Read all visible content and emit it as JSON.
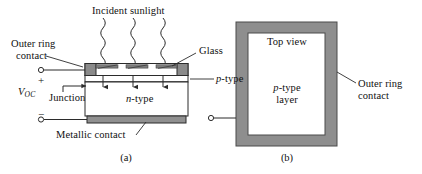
{
  "figure": {
    "colors": {
      "ink": "#101010",
      "line": "#2b2b2b",
      "glass_fill": "#ffffff",
      "contact_gray": "#8a8a8a",
      "metal_gray": "#909090",
      "ring_gray": "#8e8e8e",
      "p_layer_fill": "#ffffff",
      "background": "#ffffff"
    }
  },
  "panel_a": {
    "caption": "(a)",
    "labels": {
      "incident_sunlight": "Incident sunlight",
      "outer_ring_contact_line1": "Outer ring",
      "outer_ring_contact_line2": "contact",
      "glass": "Glass",
      "p_type": "p-type",
      "p_type_italic_part": "p",
      "p_type_rest": "-type",
      "n_type_italic_part": "n",
      "n_type_rest": "-type",
      "junction": "Junction",
      "metallic_contact": "Metallic contact",
      "voc_symbol": "V",
      "voc_subscript": "OC",
      "plus_sign": "+",
      "minus_sign": "−"
    },
    "ray_count": 3,
    "junction_arrow_count": 4,
    "surface_contact_count": 3
  },
  "panel_b": {
    "caption": "(b)",
    "labels": {
      "top_view": "Top view",
      "p_type_layer_line1": "p-type",
      "p_type_layer_line2": "layer",
      "p_type_italic_part": "p",
      "p_type_rest": "-type",
      "outer_ring_contact_line1": "Outer ring",
      "outer_ring_contact_line2": "contact"
    }
  }
}
